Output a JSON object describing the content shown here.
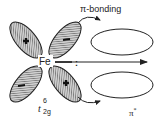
{
  "diagram": {
    "labels": {
      "metal": "Fe",
      "pi_bonding": "π-bonding",
      "pi_star": "π",
      "pi_star_superscript": "*",
      "t2g_base": "t",
      "t2g_subscript": "2g",
      "t2g_superscript": "6",
      "lone_pair": ":"
    },
    "lobes": [
      {
        "position": "upper-left",
        "sign": "+"
      },
      {
        "position": "upper-right",
        "sign": "−"
      },
      {
        "position": "lower-left",
        "sign": "−"
      },
      {
        "position": "lower-right",
        "sign": "+"
      }
    ],
    "ligand_orbitals": [
      {
        "position": "upper",
        "label": "π-bonding"
      },
      {
        "position": "lower",
        "label": "π*"
      }
    ],
    "colors": {
      "line": "#222222",
      "hatch": "#555555",
      "lobe_fill": "#b8b8b8",
      "background": "#ffffff"
    }
  }
}
